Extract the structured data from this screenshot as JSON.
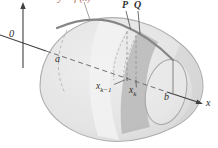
{
  "figure": {
    "labels": {
      "curve": "y = f (x)",
      "point_p": "P",
      "point_q": "Q",
      "origin": "0",
      "a": "a",
      "b": "b",
      "x_axis": "x",
      "x_prev_base": "x",
      "x_prev_sub": "k−1",
      "x_k_base": "x",
      "x_k_sub": "k"
    },
    "colors": {
      "body": "#e6e6e6",
      "body_edge": "#aeaeae",
      "band_dark": "#b5b5b5",
      "band_light": "#f2f2f2",
      "curve": "#868686",
      "axis": "#3f3f3f",
      "dashed": "#8f8f8f",
      "label": "#2d2d2d",
      "curve_label": "#a8604e",
      "background": "#ffffff",
      "face_edge": "#a5a5a5",
      "lune": "#d0d0d0"
    }
  }
}
